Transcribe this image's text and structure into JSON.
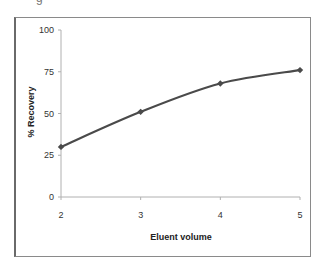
{
  "header": {
    "fragment": "g"
  },
  "chart_data": {
    "type": "line",
    "title": "",
    "xlabel": "Eluent volume",
    "ylabel": "% Recovery",
    "x": [
      2,
      3,
      4,
      5
    ],
    "series": [
      {
        "name": "% Recovery",
        "values": [
          30,
          51,
          68,
          76
        ],
        "color": "#4a4a4a",
        "marker": "diamond"
      }
    ],
    "xlim": [
      2,
      5
    ],
    "ylim": [
      0,
      100
    ],
    "xticks": [
      "2",
      "3",
      "4",
      "5"
    ],
    "yticks": [
      "0",
      "25",
      "50",
      "75",
      "100"
    ],
    "grid": false,
    "legend": "none"
  }
}
